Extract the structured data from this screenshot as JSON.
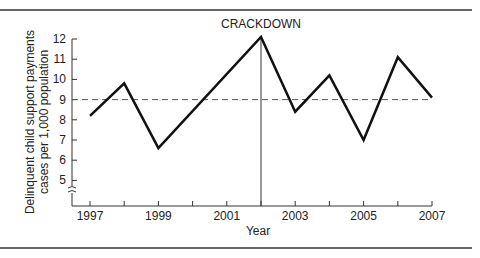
{
  "chart_data": {
    "type": "line",
    "title": "",
    "annotation": "CRACKDOWN",
    "annotation_x": 2002,
    "xlabel": "Year",
    "ylabel_line1": "Delinquent child support payments",
    "ylabel_line2": "cases per 1,000 population",
    "x": [
      1997,
      1998,
      1999,
      2000,
      2001,
      2002,
      2003,
      2004,
      2005,
      2006,
      2007
    ],
    "series": [
      {
        "name": "Delinquent cases",
        "points": [
          [
            1997,
            8.2
          ],
          [
            1998,
            9.8
          ],
          [
            1999,
            6.6
          ],
          [
            2002,
            12.1
          ],
          [
            2003,
            8.4
          ],
          [
            2004,
            10.2
          ],
          [
            2005,
            7.0
          ],
          [
            2006,
            11.1
          ],
          [
            2007,
            9.1
          ]
        ]
      }
    ],
    "reference_line": {
      "y": 9.0,
      "style": "dashed"
    },
    "xticks": [
      "1997",
      "1999",
      "2001",
      "2003",
      "2005",
      "2007"
    ],
    "yticks": [
      "5",
      "6",
      "7",
      "8",
      "9",
      "10",
      "11",
      "12"
    ],
    "ylim": [
      4,
      12
    ],
    "axis_break": true,
    "grid": false
  }
}
